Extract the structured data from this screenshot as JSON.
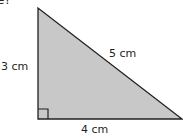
{
  "question_fragment": "e?",
  "triangle": {
    "fill": "#c8c8c8",
    "stroke": "#231f20",
    "right_angle_marker": true,
    "sides": {
      "vertical": "3 cm",
      "hypotenuse": "5 cm",
      "horizontal": "4 cm"
    }
  }
}
